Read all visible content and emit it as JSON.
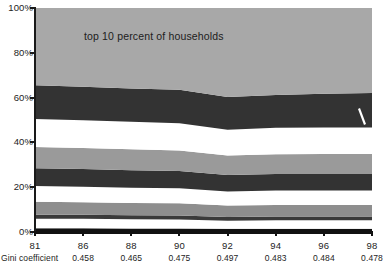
{
  "chart_data": {
    "type": "area",
    "title": "",
    "subtitle": "",
    "xlabel": "",
    "ylabel": "",
    "annotations": [
      {
        "text": "top 10 percent of households",
        "x": 90,
        "y": 88
      }
    ],
    "grid": false,
    "legend": "none",
    "stacked": true,
    "normalized": true,
    "ylim": [
      0,
      100
    ],
    "yticks": [
      0,
      20,
      40,
      60,
      80,
      100
    ],
    "ytick_labels": [
      "0%",
      "20%",
      "40%",
      "60%",
      "80%",
      "100%"
    ],
    "x": [
      81,
      86,
      88,
      90,
      92,
      94,
      96,
      98
    ],
    "xtick_labels": [
      "81",
      "86",
      "88",
      "90",
      "92",
      "94",
      "96",
      "98"
    ],
    "secondary_axis_label": "Gini coefficient",
    "secondary_axis_values": [
      "0.458",
      "0.465",
      "0.475",
      "0.497",
      "0.483",
      "0.484",
      "0.478"
    ],
    "secondary_axis_x": [
      86,
      88,
      90,
      92,
      94,
      96,
      98
    ],
    "series": [
      {
        "name": "decile-1-bottom",
        "color": "#111111",
        "values": [
          1.7,
          1.7,
          1.6,
          1.6,
          1.4,
          1.5,
          1.5,
          1.5
        ]
      },
      {
        "name": "decile-2",
        "color": "#ffffff",
        "values": [
          4.2,
          4.2,
          4.1,
          4.0,
          3.6,
          3.7,
          3.7,
          3.7
        ]
      },
      {
        "name": "decile-3",
        "color": "#3a3a3a",
        "values": [
          1.8,
          1.8,
          1.8,
          1.8,
          1.7,
          1.7,
          1.7,
          1.7
        ]
      },
      {
        "name": "decile-4",
        "color": "#8e8e8e",
        "values": [
          5.8,
          5.6,
          5.5,
          5.4,
          5.1,
          5.2,
          5.2,
          5.2
        ]
      },
      {
        "name": "decile-5",
        "color": "#ffffff",
        "values": [
          7.0,
          6.9,
          6.8,
          6.7,
          6.3,
          6.4,
          6.4,
          6.4
        ]
      },
      {
        "name": "decile-6",
        "color": "#333333",
        "values": [
          8.0,
          7.9,
          7.8,
          7.7,
          7.3,
          7.4,
          7.4,
          7.4
        ]
      },
      {
        "name": "decile-7",
        "color": "#9a9a9a",
        "values": [
          9.5,
          9.4,
          9.3,
          9.2,
          8.7,
          8.8,
          8.9,
          8.9
        ]
      },
      {
        "name": "decile-8",
        "color": "#ffffff",
        "values": [
          12.5,
          12.4,
          12.3,
          12.2,
          11.6,
          11.8,
          11.9,
          11.9
        ]
      },
      {
        "name": "decile-9",
        "color": "#333333",
        "values": [
          15.0,
          14.9,
          14.9,
          14.9,
          14.6,
          14.7,
          15.0,
          15.4
        ]
      },
      {
        "name": "decile-10-top",
        "color": "#a8a8a8",
        "values": [
          34.5,
          35.2,
          35.9,
          36.5,
          39.7,
          38.8,
          38.3,
          37.9
        ]
      }
    ],
    "cumulative_tops": {
      "81": [
        1.7,
        5.9,
        7.7,
        13.5,
        20.5,
        28.5,
        38.0,
        50.5,
        65.5,
        100
      ],
      "86": [
        1.7,
        5.9,
        7.7,
        13.3,
        20.2,
        28.1,
        37.5,
        49.9,
        64.8,
        100
      ],
      "88": [
        1.6,
        5.7,
        7.5,
        13.0,
        19.8,
        27.6,
        36.9,
        49.2,
        64.1,
        100
      ],
      "90": [
        1.6,
        5.6,
        7.4,
        12.8,
        19.5,
        27.2,
        36.4,
        48.6,
        63.5,
        100
      ],
      "92": [
        1.4,
        5.0,
        6.7,
        11.8,
        18.1,
        25.4,
        34.1,
        45.7,
        60.3,
        100
      ],
      "94": [
        1.5,
        5.2,
        6.9,
        12.1,
        18.5,
        25.9,
        34.7,
        46.5,
        61.2,
        100
      ],
      "96": [
        1.5,
        5.2,
        6.9,
        12.1,
        18.5,
        25.9,
        34.8,
        46.7,
        61.7,
        100
      ],
      "98": [
        1.5,
        5.2,
        6.9,
        12.1,
        18.5,
        25.9,
        34.8,
        46.7,
        62.1,
        100
      ]
    }
  },
  "axes": {
    "y": {
      "labels": [
        "100%",
        "80%",
        "60%",
        "40%",
        "20%",
        "0%"
      ],
      "values": [
        100,
        80,
        60,
        40,
        20,
        0
      ]
    },
    "x": {
      "labels": [
        "81",
        "86",
        "88",
        "90",
        "92",
        "94",
        "96",
        "98"
      ]
    }
  },
  "gini": {
    "caption": "Gini coefficient",
    "values": [
      "0.458",
      "0.465",
      "0.475",
      "0.497",
      "0.483",
      "0.484",
      "0.478"
    ]
  },
  "annotation": {
    "text": "top 10 percent of households"
  },
  "colors": {
    "band_light_gray": "#a8a8a8",
    "band_mid_gray": "#8e8e8e",
    "band_dark": "#333333",
    "band_black": "#111111",
    "band_white": "#ffffff",
    "axis": "#1a1a1a",
    "text": "#1d1d1d"
  }
}
